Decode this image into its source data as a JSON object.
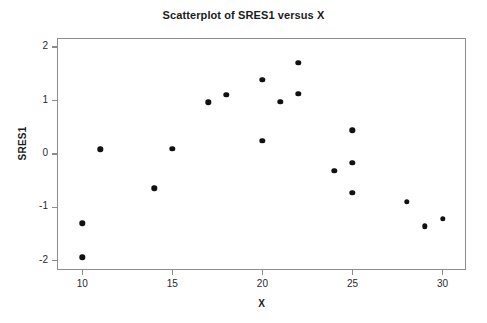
{
  "chart_data": {
    "type": "scatter",
    "title": "Scatterplot of SRES1 versus X",
    "xlabel": "X",
    "ylabel": "SRES1",
    "xlim": [
      8.6,
      31.3
    ],
    "ylim": [
      -2.17,
      2.17
    ],
    "xticks": [
      10,
      15,
      20,
      25,
      30
    ],
    "yticks": [
      2,
      1,
      0,
      -1,
      -2
    ],
    "xtick_labels": [
      "10",
      "15",
      "20",
      "25",
      "30"
    ],
    "ytick_labels": [
      "2",
      "1",
      "0",
      "-1",
      "-2"
    ],
    "grid": false,
    "legend": "none",
    "marker": "filled-circle",
    "marker_color": "#111111",
    "frame_color": "#8d8d8d",
    "background": "#ffffff",
    "points": [
      {
        "x": 10,
        "y": -1.3
      },
      {
        "x": 10,
        "y": -1.93
      },
      {
        "x": 11,
        "y": 0.09
      },
      {
        "x": 14,
        "y": -0.64
      },
      {
        "x": 15,
        "y": 0.1
      },
      {
        "x": 17,
        "y": 0.97
      },
      {
        "x": 18,
        "y": 1.11
      },
      {
        "x": 20,
        "y": 0.25
      },
      {
        "x": 20,
        "y": 1.39
      },
      {
        "x": 21,
        "y": 0.98
      },
      {
        "x": 22,
        "y": 1.71
      },
      {
        "x": 22,
        "y": 1.13
      },
      {
        "x": 24,
        "y": -0.31
      },
      {
        "x": 25,
        "y": 0.44
      },
      {
        "x": 25,
        "y": -0.16
      },
      {
        "x": 25,
        "y": -0.73
      },
      {
        "x": 28,
        "y": -0.89
      },
      {
        "x": 29,
        "y": -1.35
      },
      {
        "x": 30,
        "y": -1.21
      }
    ]
  }
}
